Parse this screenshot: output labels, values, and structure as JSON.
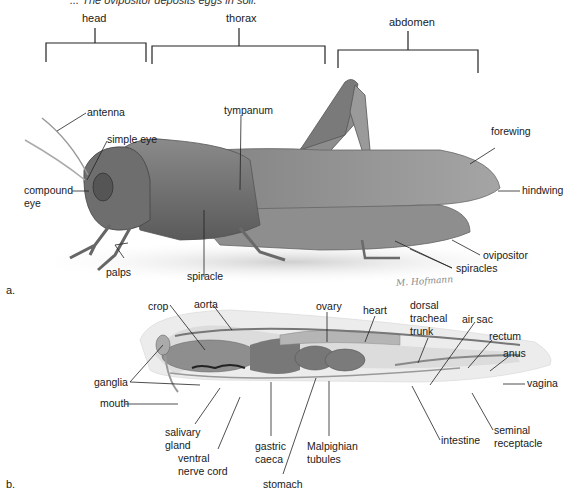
{
  "caption_fragment": "... The ovipositor deposits eggs in soil.",
  "segments": {
    "head": "head",
    "thorax": "thorax",
    "abdomen": "abdomen"
  },
  "panel_a": {
    "marker": "a.",
    "labels": {
      "antenna": "antenna",
      "simple_eye": "simple eye",
      "compound_eye_1": "compound",
      "compound_eye_2": "eye",
      "tympanum": "tympanum",
      "forewing": "forewing",
      "hindwing": "hindwing",
      "ovipositor": "ovipositor",
      "spiracles": "spiracles",
      "spiracle": "spiracle",
      "palps": "palps"
    },
    "signature": "M. Hofmann"
  },
  "panel_b": {
    "marker": "b.",
    "labels": {
      "crop": "crop",
      "aorta": "aorta",
      "ovary": "ovary",
      "heart": "heart",
      "dorsal_1": "dorsal",
      "dorsal_2": "tracheal",
      "dorsal_3": "trunk",
      "air_sac": "air sac",
      "rectum": "rectum",
      "anus": "anus",
      "vagina": "vagina",
      "ganglia": "ganglia",
      "mouth": "mouth",
      "salivary_1": "salivary",
      "salivary_2": "gland",
      "ventral_1": "ventral",
      "ventral_2": "nerve cord",
      "gastric_1": "gastric",
      "gastric_2": "caeca",
      "malpighian_1": "Malpighian",
      "malpighian_2": "tubules",
      "stomach": "stomach",
      "intestine": "intestine",
      "seminal_1": "seminal",
      "seminal_2": "receptacle"
    }
  }
}
